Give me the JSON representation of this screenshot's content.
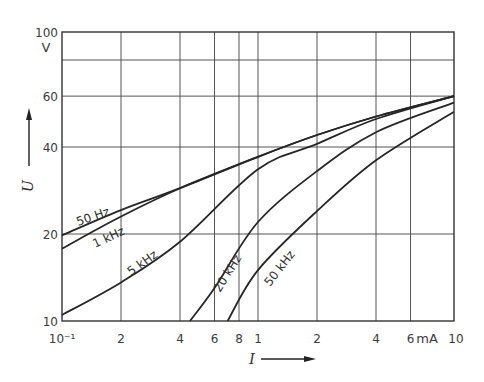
{
  "chart_data": {
    "type": "line",
    "title": "",
    "xlabel": "I",
    "xunit": "mA",
    "ylabel": "U",
    "yunit": "V",
    "xscale": "log",
    "yscale": "log",
    "xlim": [
      0.1,
      10
    ],
    "ylim": [
      10,
      100
    ],
    "grid": true,
    "legend": "inline curve labels",
    "x_ticks": [
      {
        "value": 0.1,
        "label": "10⁻¹"
      },
      {
        "value": 0.2,
        "label": "2"
      },
      {
        "value": 0.4,
        "label": "4"
      },
      {
        "value": 0.6,
        "label": "6"
      },
      {
        "value": 0.8,
        "label": "8"
      },
      {
        "value": 1,
        "label": "1"
      },
      {
        "value": 2,
        "label": "2"
      },
      {
        "value": 4,
        "label": "4"
      },
      {
        "value": 6,
        "label": "6"
      },
      {
        "value": 10,
        "label": "10"
      }
    ],
    "y_ticks": [
      {
        "value": 10,
        "label": "10"
      },
      {
        "value": 20,
        "label": "20"
      },
      {
        "value": 40,
        "label": "40"
      },
      {
        "value": 60,
        "label": "60"
      },
      {
        "value": 80,
        "label": ""
      },
      {
        "value": 100,
        "label": "100"
      }
    ],
    "series": [
      {
        "name": "50 Hz",
        "x": [
          0.1,
          0.2,
          0.4,
          1,
          2,
          4,
          10
        ],
        "y": [
          19.8,
          24.2,
          28.8,
          37,
          44,
          51,
          60
        ]
      },
      {
        "name": "1 kHz",
        "x": [
          0.1,
          0.2,
          0.4,
          1,
          2,
          4,
          10
        ],
        "y": [
          17.8,
          23,
          28.8,
          37,
          44,
          51,
          60
        ]
      },
      {
        "name": "5 kHz",
        "x": [
          0.1,
          0.2,
          0.4,
          1,
          2,
          4,
          10
        ],
        "y": [
          10.5,
          13.6,
          18.8,
          33.5,
          41,
          50,
          60
        ]
      },
      {
        "name": "20 kHz",
        "x": [
          0.45,
          0.6,
          1,
          2,
          4,
          10
        ],
        "y": [
          10,
          13,
          22,
          33,
          45,
          57
        ]
      },
      {
        "name": "50 kHz",
        "x": [
          0.7,
          1,
          2,
          4,
          10
        ],
        "y": [
          10,
          15,
          24,
          36,
          53
        ]
      }
    ]
  },
  "labels": {
    "y_unit": "V",
    "x_unit": "mA",
    "y_axis_name": "U",
    "x_axis_name": "I",
    "curves": [
      "50 Hz",
      "1 kHz",
      "5 kHz",
      "20 kHz",
      "50 kHz"
    ]
  }
}
